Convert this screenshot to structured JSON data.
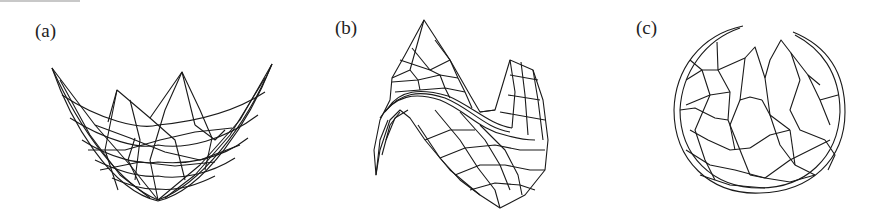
{
  "figure": {
    "panels": [
      {
        "id": "a",
        "label": "(a)",
        "description": "paraboloid bowl wireframe mesh"
      },
      {
        "id": "b",
        "label": "(b)",
        "description": "saddle / wave surface wireframe mesh"
      },
      {
        "id": "c",
        "label": "(c)",
        "description": "sphere wireframe mesh with opening at top"
      }
    ]
  }
}
